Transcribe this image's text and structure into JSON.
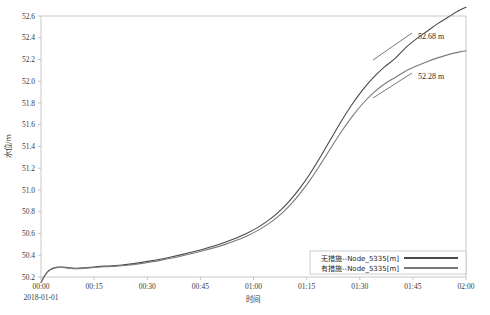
{
  "chart_data": {
    "type": "line",
    "title": "",
    "xlabel": "时间",
    "ylabel": "水位/m",
    "start_date": "2018-01-01",
    "grid": false,
    "legend_position": "bottom-right",
    "xlim": [
      0,
      120
    ],
    "ylim": [
      50.2,
      52.6
    ],
    "x_tick_labels": [
      "00:00",
      "00:15",
      "00:30",
      "00:45",
      "01:00",
      "01:15",
      "01:30",
      "01:45",
      "02:00"
    ],
    "x_tick_values": [
      0,
      15,
      30,
      45,
      60,
      75,
      90,
      105,
      120
    ],
    "y_tick_labels": [
      "50.2",
      "50.4",
      "50.6",
      "50.8",
      "51.0",
      "51.2",
      "51.4",
      "51.6",
      "51.8",
      "52.0",
      "52.2",
      "52.4",
      "52.6"
    ],
    "y_tick_values": [
      50.2,
      50.4,
      50.6,
      50.8,
      51.0,
      51.2,
      51.4,
      51.6,
      51.8,
      52.0,
      52.2,
      52.4,
      52.6
    ],
    "x": [
      0,
      1,
      2,
      3,
      4,
      5,
      6,
      7,
      8,
      9,
      10,
      12,
      14,
      16,
      18,
      20,
      22,
      25,
      28,
      31,
      34,
      37,
      40,
      43,
      46,
      49,
      52,
      55,
      58,
      61,
      64,
      67,
      70,
      73,
      76,
      79,
      82,
      85,
      88,
      91,
      94,
      97,
      100,
      103,
      106,
      109,
      112,
      115,
      118,
      120
    ],
    "series": [
      {
        "name": "无措施--Node_5335[m]",
        "color": "#4a4a4a",
        "values": [
          50.15,
          50.21,
          50.255,
          50.275,
          50.287,
          50.292,
          50.292,
          50.289,
          50.285,
          50.282,
          50.281,
          50.284,
          50.29,
          50.296,
          50.3,
          50.303,
          50.308,
          50.318,
          50.332,
          50.348,
          50.366,
          50.386,
          50.408,
          50.432,
          50.458,
          50.487,
          50.52,
          50.557,
          50.6,
          50.652,
          50.716,
          50.795,
          50.893,
          51.012,
          51.152,
          51.31,
          51.478,
          51.643,
          51.795,
          51.928,
          52.04,
          52.132,
          52.21,
          52.31,
          52.39,
          52.46,
          52.53,
          52.59,
          52.65,
          52.68
        ]
      },
      {
        "name": "有措施--Node_5335[m]",
        "color": "#7a7a7a",
        "values": [
          50.15,
          50.208,
          50.25,
          50.27,
          50.282,
          50.287,
          50.287,
          50.284,
          50.28,
          50.277,
          50.276,
          50.279,
          50.284,
          50.29,
          50.294,
          50.297,
          50.301,
          50.31,
          50.323,
          50.338,
          50.355,
          50.374,
          50.395,
          50.418,
          50.443,
          50.47,
          50.5,
          50.535,
          50.575,
          50.624,
          50.684,
          50.758,
          50.85,
          50.962,
          51.093,
          51.24,
          51.395,
          51.545,
          51.682,
          51.8,
          51.898,
          51.975,
          52.035,
          52.095,
          52.14,
          52.18,
          52.215,
          52.245,
          52.268,
          52.28
        ]
      }
    ],
    "annotations": [
      {
        "text": "52.68 m",
        "x": 103,
        "y": 52.46,
        "series": 0
      },
      {
        "text": "52.28 m",
        "x": 103,
        "y": 52.13,
        "series": 1
      }
    ]
  }
}
